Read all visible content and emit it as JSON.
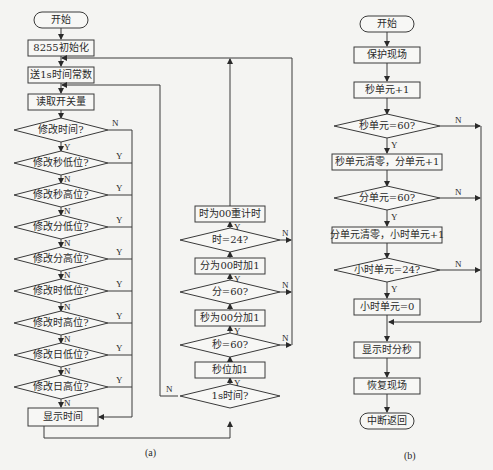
{
  "diagram": {
    "a": {
      "caption": "(a)",
      "start": "开始",
      "init": "8255初始化",
      "send_const": "送1s时间常数",
      "read_switch": "读取开关量",
      "decisions": [
        "修改时间?",
        "修改秒低位?",
        "修改秒高位?",
        "修改分低位?",
        "修改分高位?",
        "修改时低位?",
        "修改时高位?",
        "修改日低位?",
        "修改日高位?"
      ],
      "display_time": "显示时间",
      "timer_chain": {
        "hour_reset": "时为00重计时",
        "hour_check": "时=24?",
        "min_reset": "分为00时加1",
        "min_check": "分=60?",
        "sec_reset": "秒为00分加1",
        "sec_check": "秒=60?",
        "sec_inc": "秒位加1",
        "one_sec_check": "1s时间?"
      }
    },
    "b": {
      "caption": "(b)",
      "start": "开始",
      "save": "保护现场",
      "sec_inc": "秒单元+1",
      "sec_check": "秒单元=60?",
      "sec_clear": "秒单元清零，分单元+1",
      "min_check": "分单元=60?",
      "min_clear": "分单元清零，小时单元+1",
      "hour_check": "小时单元=24?",
      "hour_clear": "小时单元=0",
      "display": "显示时分秒",
      "restore": "恢复现场",
      "return": "中断返回"
    },
    "labels": {
      "yes": "Y",
      "no": "N"
    }
  }
}
